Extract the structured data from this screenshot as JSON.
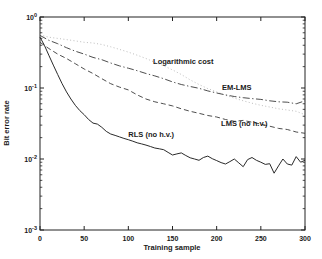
{
  "chart_data": {
    "type": "line",
    "title": "",
    "xlabel": "Training sample",
    "ylabel": "Bit error rate",
    "xlim": [
      0,
      300
    ],
    "x_ticks": [
      0,
      50,
      100,
      150,
      200,
      250,
      300
    ],
    "yscale": "log",
    "ylim": [
      0.001,
      1
    ],
    "y_ticks": [
      "10^0",
      "10^-1",
      "10^-2",
      "10^-3"
    ],
    "grid": false,
    "legend_position": "inline-annotations",
    "frame_color": "#222222",
    "series": [
      {
        "name": "Logarithmic cost",
        "style": "dotted",
        "color": "#b5b5b5",
        "x": [
          0,
          10,
          20,
          30,
          40,
          50,
          60,
          70,
          80,
          90,
          100,
          110,
          120,
          130,
          140,
          150,
          160,
          170,
          180,
          190,
          200,
          210,
          220,
          230,
          240,
          250,
          260,
          270,
          280,
          290,
          300
        ],
        "y": [
          0.56,
          0.52,
          0.5,
          0.48,
          0.46,
          0.44,
          0.43,
          0.41,
          0.38,
          0.35,
          0.32,
          0.29,
          0.26,
          0.23,
          0.205,
          0.18,
          0.155,
          0.13,
          0.112,
          0.098,
          0.088,
          0.079,
          0.072,
          0.066,
          0.061,
          0.057,
          0.054,
          0.051,
          0.049,
          0.047,
          0.042
        ]
      },
      {
        "name": "EM-LMS",
        "style": "dashdot",
        "color": "#3a3a3a",
        "x": [
          0,
          10,
          20,
          30,
          40,
          50,
          60,
          70,
          80,
          90,
          100,
          110,
          120,
          130,
          140,
          150,
          160,
          170,
          180,
          190,
          200,
          210,
          220,
          230,
          240,
          250,
          260,
          270,
          280,
          290,
          300
        ],
        "y": [
          0.55,
          0.47,
          0.42,
          0.37,
          0.33,
          0.3,
          0.27,
          0.25,
          0.225,
          0.205,
          0.19,
          0.175,
          0.16,
          0.148,
          0.135,
          0.122,
          0.112,
          0.105,
          0.099,
          0.091,
          0.085,
          0.08,
          0.076,
          0.073,
          0.071,
          0.069,
          0.066,
          0.064,
          0.063,
          0.06,
          0.066
        ]
      },
      {
        "name": "LMS (no h.v.)",
        "style": "dashed",
        "color": "#3a3a3a",
        "x": [
          0,
          10,
          20,
          30,
          40,
          50,
          60,
          70,
          80,
          90,
          100,
          110,
          120,
          130,
          140,
          150,
          160,
          170,
          180,
          190,
          200,
          210,
          220,
          230,
          240,
          250,
          260,
          270,
          280,
          290,
          300
        ],
        "y": [
          0.44,
          0.36,
          0.3,
          0.26,
          0.22,
          0.185,
          0.16,
          0.135,
          0.115,
          0.103,
          0.094,
          0.08,
          0.07,
          0.064,
          0.06,
          0.056,
          0.051,
          0.047,
          0.044,
          0.041,
          0.039,
          0.036,
          0.034,
          0.035,
          0.033,
          0.031,
          0.029,
          0.027,
          0.026,
          0.024,
          0.023
        ]
      },
      {
        "name": "RLS (no h.v.)",
        "style": "solid",
        "color": "#2a2a2a",
        "x": [
          0,
          5,
          10,
          15,
          20,
          25,
          30,
          35,
          40,
          45,
          50,
          55,
          60,
          65,
          70,
          75,
          80,
          85,
          90,
          95,
          100,
          105,
          110,
          115,
          120,
          125,
          130,
          135,
          140,
          145,
          150,
          155,
          160,
          165,
          170,
          175,
          180,
          185,
          190,
          195,
          200,
          205,
          210,
          215,
          220,
          225,
          230,
          235,
          240,
          245,
          250,
          255,
          260,
          265,
          270,
          275,
          280,
          285,
          290,
          295,
          300
        ],
        "y": [
          0.52,
          0.4,
          0.29,
          0.21,
          0.155,
          0.115,
          0.088,
          0.07,
          0.057,
          0.048,
          0.042,
          0.036,
          0.032,
          0.031,
          0.028,
          0.0245,
          0.0225,
          0.0215,
          0.0205,
          0.0195,
          0.0187,
          0.0178,
          0.0169,
          0.0163,
          0.0157,
          0.015,
          0.0143,
          0.0139,
          0.0135,
          0.0124,
          0.0114,
          0.0118,
          0.0122,
          0.0112,
          0.0104,
          0.01,
          0.0096,
          0.0105,
          0.011,
          0.0101,
          0.0095,
          0.0089,
          0.0085,
          0.0092,
          0.01,
          0.0088,
          0.0078,
          0.0098,
          0.0105,
          0.0096,
          0.009,
          0.0084,
          0.0086,
          0.0063,
          0.008,
          0.01,
          0.0085,
          0.0082,
          0.0108,
          0.009,
          0.0096
        ]
      }
    ],
    "annotations": [
      {
        "text": "Logarithmic cost",
        "x": 128,
        "y": 0.215
      },
      {
        "text": "EM-LMS",
        "x": 206,
        "y": 0.094
      },
      {
        "text": "LMS (no h.v.)",
        "x": 205,
        "y": 0.029
      },
      {
        "text": "RLS (no h.v.)",
        "x": 100,
        "y": 0.0205
      }
    ]
  }
}
